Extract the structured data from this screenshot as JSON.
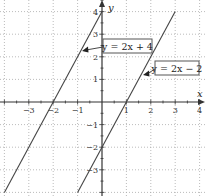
{
  "chart_data": {
    "type": "line",
    "title": "",
    "xlabel": "x",
    "ylabel": "y",
    "xlim": [
      -4.1,
      4.2
    ],
    "ylim": [
      -4.1,
      4.5
    ],
    "grid": true,
    "x_ticks": [
      -3,
      -2,
      -1,
      1,
      2,
      3,
      4
    ],
    "y_ticks": [
      -3,
      -2,
      -1,
      1,
      2,
      3,
      4
    ],
    "series": [
      {
        "name": "y = 2x + 4",
        "equation": {
          "slope": 2,
          "intercept": 4
        },
        "points": [
          [
            -4,
            -4
          ],
          [
            0,
            4
          ]
        ],
        "annotation": {
          "label": "y = 2x + 4",
          "arrow_to": [
            -0.8,
            2.4
          ]
        }
      },
      {
        "name": "y = 2x − 2",
        "equation": {
          "slope": 2,
          "intercept": -2
        },
        "points": [
          [
            -1,
            -4
          ],
          [
            3,
            4
          ]
        ],
        "annotation": {
          "label": "y = 2x − 2",
          "arrow_to": [
            1.7,
            1.2
          ]
        }
      }
    ],
    "legend": "none (inline boxed labels with arrows)"
  },
  "labels": {
    "x_axis": "x",
    "y_axis": "y",
    "eq1": "y = 2x + 4",
    "eq2": "y = 2x − 2"
  },
  "colors": {
    "line": "#444444",
    "axis": "#333333",
    "grid": "#aaaaaa"
  }
}
